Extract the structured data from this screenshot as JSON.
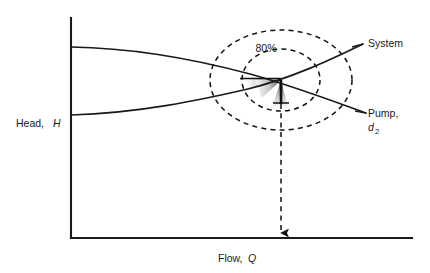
{
  "figure": {
    "background_color": "#ffffff",
    "line_color": "#1a1a1a"
  },
  "axes": {
    "y_axis_label_text": "Head,",
    "y_axis_label_symbol": "H",
    "x_axis_label_text": "Flow,",
    "x_axis_label_symbol": "Q",
    "origin_x": 71,
    "origin_y": 238,
    "y_axis_top": 18,
    "x_axis_right": 412
  },
  "curves": [
    {
      "name": "pump-curve",
      "label_text": "Pump,",
      "label_subscript": "d",
      "label_subscript_index": "2",
      "start_point": [
        71,
        47
      ],
      "end_point": [
        366,
        113
      ],
      "description": "Pump head curve, falling to the right"
    },
    {
      "name": "system-curve",
      "label_text": "System",
      "start_point": [
        71,
        115
      ],
      "end_point": [
        363,
        44
      ],
      "description": "System resistance curve, rising to the right"
    }
  ],
  "efficiency_contours": [
    {
      "name": "outer-efficiency-contour",
      "center": [
        281,
        80
      ],
      "radius_x": 71,
      "radius_y": 50,
      "style": "dashed"
    },
    {
      "name": "inner-efficiency-contour",
      "center": [
        281,
        80
      ],
      "radius_x": 39,
      "radius_y": 31,
      "style": "dashed",
      "label": "80%"
    }
  ],
  "efficiency_label": "80%",
  "operating_point": {
    "name": "operating-point",
    "x": 281,
    "y": 80,
    "description": "Intersection of pump and system curves"
  },
  "drop_line": {
    "name": "operating-point-drop-line",
    "from": [
      281,
      80
    ],
    "to": [
      281,
      236
    ],
    "style": "dashed",
    "arrow_at": "bottom"
  }
}
